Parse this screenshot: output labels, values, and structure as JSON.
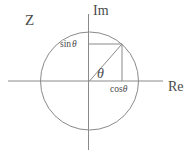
{
  "figure": {
    "title_label": "Z",
    "background_color": "#ffffff",
    "stroke_color": "#8a8a8a",
    "text_color": "#4a4a4a",
    "width": 194,
    "height": 163
  },
  "axes": {
    "imaginary": {
      "label": "Im",
      "orientation": "vertical",
      "x": 88.5,
      "y_top": 14,
      "y_bottom": 150,
      "label_x": 93,
      "label_y": 4
    },
    "real": {
      "label": "Re",
      "orientation": "horizontal",
      "y": 81,
      "x_left": 8,
      "x_right": 163,
      "label_x": 168,
      "label_y": 80
    }
  },
  "circle": {
    "name": "unit-circle",
    "center_x": 89.5,
    "center_y": 81,
    "radius": 49
  },
  "point": {
    "name": "point-on-unit-circle",
    "x": 122,
    "y": 44
  },
  "annotations": {
    "angle": {
      "label": "θ",
      "x": 97,
      "y": 67
    },
    "sine": {
      "label_prefix": "sin",
      "label_symbol": "θ",
      "x": 60,
      "y": 40
    },
    "cosine": {
      "label_prefix": "cos",
      "label_symbol": "θ",
      "x": 110,
      "y": 85
    }
  },
  "guides": {
    "radius_line": {
      "name": "radius-line",
      "x1": 89.5,
      "y1": 81,
      "x2": 122,
      "y2": 44
    },
    "sine_leader": {
      "name": "sine-leader-line",
      "x1": 88.5,
      "y1": 44,
      "x2": 122,
      "y2": 44
    },
    "cosine_dropline": {
      "name": "cosine-dropline",
      "x1": 122,
      "y1": 44,
      "x2": 122,
      "y2": 81
    }
  },
  "chart_data": {
    "type": "scatter",
    "title": "Z",
    "xlabel": "Re",
    "ylabel": "Im",
    "xlim": [
      -1.65,
      1.5
    ],
    "ylim": [
      -1.4,
      1.37
    ],
    "grid": false,
    "legend": null,
    "series": [
      {
        "name": "unit-circle",
        "kind": "circle",
        "center": [
          0,
          0
        ],
        "radius": 1
      },
      {
        "name": "point-z",
        "kind": "point",
        "x": [
          0.663
        ],
        "y": [
          0.755
        ],
        "angle_degrees": 48.7,
        "annotation": "θ"
      },
      {
        "name": "cos-theta-projection",
        "kind": "segment",
        "x": [
          0.663,
          0.663
        ],
        "y": [
          0.755,
          0
        ],
        "annotation": "cos θ"
      },
      {
        "name": "sin-theta-projection",
        "kind": "segment",
        "x": [
          0,
          0.663
        ],
        "y": [
          0.755,
          0.755
        ],
        "annotation": "sin θ"
      },
      {
        "name": "radius-vector",
        "kind": "segment",
        "x": [
          0,
          0.663
        ],
        "y": [
          0,
          0.755
        ],
        "annotation": "θ"
      }
    ],
    "annotations": [
      "Z",
      "Im",
      "Re",
      "sin θ",
      "cos θ",
      "θ"
    ]
  }
}
